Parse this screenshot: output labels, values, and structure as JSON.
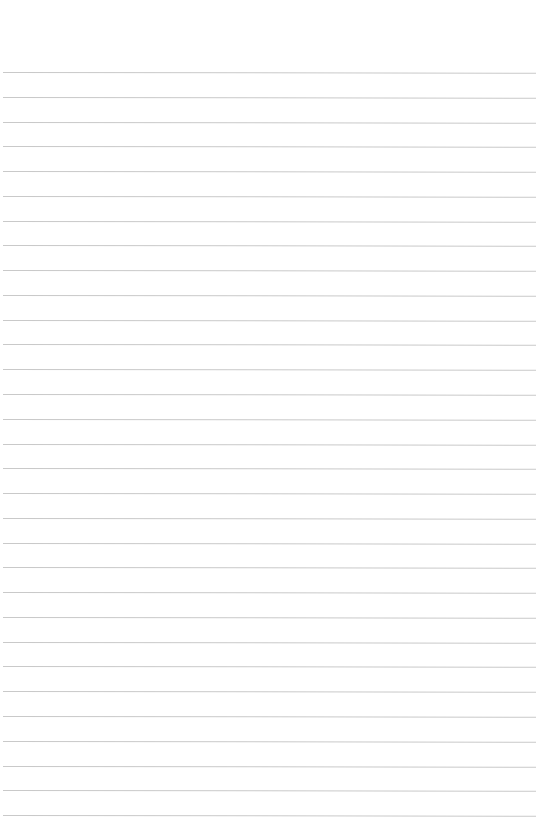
{
  "page": {
    "type": "lined-paper",
    "background_color": "#ffffff",
    "rule_color": "#c9c9c9",
    "rule_count": 31,
    "first_rule_y": 72,
    "rule_spacing": 24.77,
    "rule_left": 3,
    "rule_width": 533
  }
}
